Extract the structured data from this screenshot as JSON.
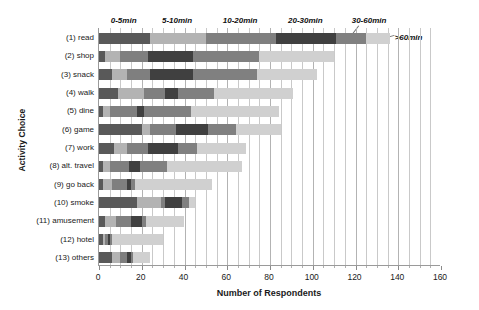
{
  "chart_data": {
    "type": "bar",
    "subtype": "stacked-horizontal",
    "title": "",
    "xlabel": "Number of Respondents",
    "ylabel": "Activity Choice",
    "xlim": [
      0,
      160
    ],
    "xticks": [
      0,
      20,
      40,
      60,
      80,
      100,
      120,
      140,
      160
    ],
    "minor_tick_interval": 5,
    "grid": true,
    "grid_axis": "x",
    "legend_position": "top-inline-callouts",
    "categories": [
      "(1) read",
      "(2) shop",
      "(3) snack",
      "(4) walk",
      "(5) dine",
      "(6) game",
      "(7) work",
      "(8) alt. travel",
      "(9) go back",
      "(10) smoke",
      "(11) amusement",
      "(12) hotel",
      "(13) others"
    ],
    "series": [
      {
        "name": "0-5min",
        "color": "#595959",
        "values": [
          24,
          3,
          6,
          9,
          2,
          20,
          7,
          2,
          2,
          18,
          3,
          2,
          6
        ]
      },
      {
        "name": "5-10min",
        "color": "#b3b3b3",
        "values": [
          26,
          7,
          7,
          12,
          3,
          4,
          6,
          3,
          4,
          11,
          5,
          1,
          4
        ]
      },
      {
        "name": "10-20min",
        "color": "#7f7f7f",
        "values": [
          33,
          13,
          11,
          10,
          13,
          12,
          10,
          9,
          7,
          2,
          7,
          1,
          3
        ]
      },
      {
        "name": "20-30min",
        "color": "#404040",
        "values": [
          28,
          21,
          20,
          6,
          3,
          15,
          14,
          5,
          2,
          8,
          5,
          1,
          2
        ]
      },
      {
        "name": "30-60min",
        "color": "#808080",
        "values": [
          14,
          31,
          30,
          17,
          22,
          13,
          9,
          13,
          2,
          3,
          2,
          1,
          1
        ]
      },
      {
        "name": ">60min",
        "color": "#d0d0d0",
        "values": [
          11,
          35,
          28,
          37,
          41,
          21,
          23,
          35,
          36,
          3,
          18,
          24,
          8
        ]
      }
    ],
    "totals": [
      136,
      110,
      102,
      91,
      84,
      85,
      69,
      67,
      53,
      45,
      40,
      30,
      24
    ]
  },
  "axis": {
    "y_title": "Activity Choice",
    "x_title": "Number of Respondents",
    "x_tick_labels": [
      "0",
      "20",
      "40",
      "60",
      "80",
      "100",
      "120",
      "140",
      "160"
    ]
  },
  "legend": {
    "entries": [
      "0-5min",
      "5-10min",
      "10-20min",
      "20-30min",
      "30-60min",
      ">60min"
    ]
  }
}
